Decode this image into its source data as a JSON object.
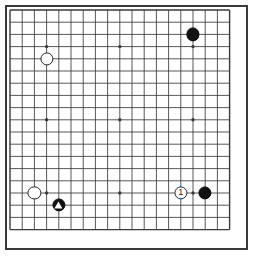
{
  "board": {
    "title": "Go board diagram",
    "type": "go-goban",
    "size": 19,
    "line_color": "#3a3a3a",
    "board_color": "#ffffff",
    "border_color": "#3a3a3a",
    "black_color": "#121212",
    "white_color": "#ffffff",
    "geometry": {
      "origin_x": 10,
      "origin_y": 10,
      "spacing": 12.2,
      "stone_radius": 6.6,
      "star_radius": 1.7
    },
    "star_points": [
      {
        "col": 3,
        "row": 3
      },
      {
        "col": 9,
        "row": 3
      },
      {
        "col": 15,
        "row": 3
      },
      {
        "col": 3,
        "row": 9
      },
      {
        "col": 9,
        "row": 9
      },
      {
        "col": 15,
        "row": 9
      },
      {
        "col": 3,
        "row": 15
      },
      {
        "col": 9,
        "row": 15
      },
      {
        "col": 15,
        "row": 15
      }
    ],
    "stones": [
      {
        "name": "white-stone-upper-left",
        "color": "white",
        "col": 3,
        "row": 4,
        "label": "",
        "marker": "none"
      },
      {
        "name": "black-stone-upper-right",
        "color": "black",
        "col": 15,
        "row": 2,
        "label": "",
        "marker": "none"
      },
      {
        "name": "white-stone-lower-left",
        "color": "white",
        "col": 2,
        "row": 15,
        "label": "",
        "marker": "none"
      },
      {
        "name": "black-stone-triangle-lower-left",
        "color": "black",
        "col": 4,
        "row": 16,
        "label": "",
        "marker": "triangle"
      },
      {
        "name": "white-stone-move-one",
        "color": "white",
        "col": 14,
        "row": 15,
        "label": "1",
        "marker": "none"
      },
      {
        "name": "black-stone-lower-right",
        "color": "black",
        "col": 16,
        "row": 15,
        "label": "",
        "marker": "none"
      }
    ]
  }
}
